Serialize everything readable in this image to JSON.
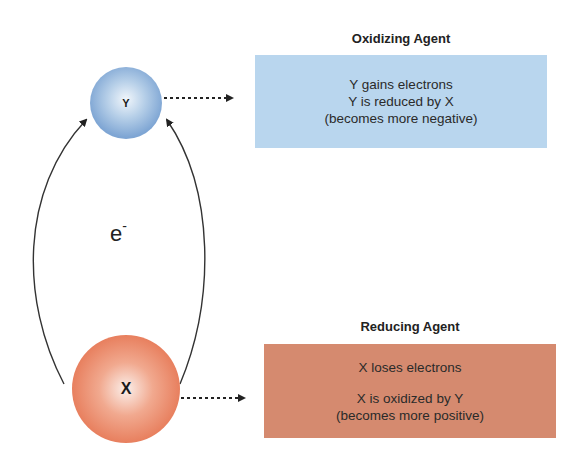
{
  "oxidizing": {
    "heading": "Oxidizing Agent",
    "atom_label": "Y",
    "lines": [
      "Y gains electrons",
      "Y is reduced by X",
      "(becomes more negative)"
    ],
    "box_color": "#b9d6ee",
    "atom_color": "#7fa6d4"
  },
  "reducing": {
    "heading": "Reducing Agent",
    "atom_label": "X",
    "lines": [
      "X loses electrons",
      "X is oxidized by Y",
      "(becomes more positive)"
    ],
    "box_color": "#d58a6f",
    "atom_color": "#e8805f"
  },
  "electron": {
    "symbol": "e",
    "charge": "-"
  },
  "icons": {
    "arrows": [
      "curved-arrow-left-x-to-y",
      "curved-arrow-right-x-to-y",
      "dotted-arrow-y-to-box",
      "dotted-arrow-x-to-box"
    ]
  }
}
